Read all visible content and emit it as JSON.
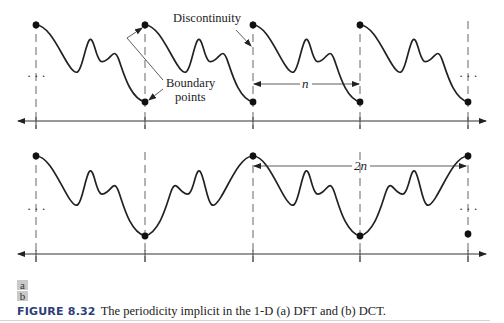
{
  "figure": {
    "number_label": "FIGURE 8.32",
    "caption": "The periodicity implicit in the 1-D (a) DFT and (b) DCT.",
    "panel_labels": [
      "a",
      "b"
    ],
    "accent_color": "#2b3d7a"
  },
  "panel_a": {
    "name": "DFT periodicity",
    "annotations": {
      "discontinuity": "Discontinuity",
      "boundary_line1": "Boundary",
      "boundary_line2": "points",
      "period_label": "n",
      "ellipsis_left": "· · ·",
      "ellipsis_right": "· · ·"
    },
    "boundaries_x": [
      36,
      145,
      253,
      360,
      468
    ],
    "top_y": 25,
    "bottom_y": 102,
    "axis_y": 121
  },
  "panel_b": {
    "name": "DCT periodicity",
    "annotations": {
      "period_label": "2n",
      "ellipsis_left": "· · ·",
      "ellipsis_right": "· · ·"
    },
    "boundaries_x": [
      36,
      145,
      253,
      360,
      468
    ],
    "top_y": 156,
    "bottom_y": 236,
    "axis_y": 254
  }
}
